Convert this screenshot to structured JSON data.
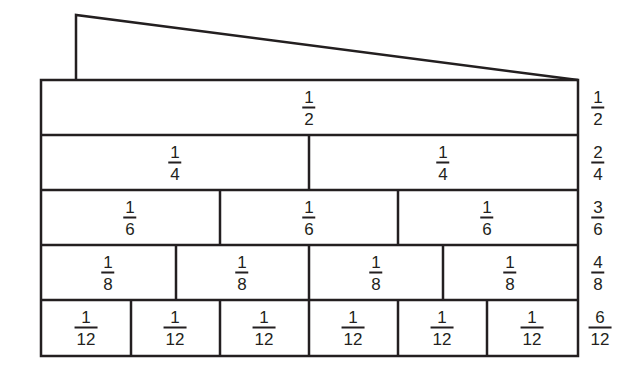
{
  "diagram": {
    "type": "fraction-wall",
    "colors": {
      "stroke": "#231f20",
      "background": "#ffffff"
    },
    "rows": [
      {
        "divisions": 2,
        "cells": [
          {
            "num": "1",
            "den": "2"
          }
        ],
        "equivalent": {
          "num": "1",
          "den": "2"
        }
      },
      {
        "divisions": 4,
        "cells": [
          {
            "num": "1",
            "den": "4"
          },
          {
            "num": "1",
            "den": "4"
          }
        ],
        "equivalent": {
          "num": "2",
          "den": "4"
        }
      },
      {
        "divisions": 6,
        "cells": [
          {
            "num": "1",
            "den": "6"
          },
          {
            "num": "1",
            "den": "6"
          },
          {
            "num": "1",
            "den": "6"
          }
        ],
        "equivalent": {
          "num": "3",
          "den": "6"
        }
      },
      {
        "divisions": 8,
        "cells": [
          {
            "num": "1",
            "den": "8"
          },
          {
            "num": "1",
            "den": "8"
          },
          {
            "num": "1",
            "den": "8"
          },
          {
            "num": "1",
            "den": "8"
          }
        ],
        "equivalent": {
          "num": "4",
          "den": "8"
        }
      },
      {
        "divisions": 12,
        "cells": [
          {
            "num": "1",
            "den": "12"
          },
          {
            "num": "1",
            "den": "12"
          },
          {
            "num": "1",
            "den": "12"
          },
          {
            "num": "1",
            "den": "12"
          },
          {
            "num": "1",
            "den": "12"
          },
          {
            "num": "1",
            "den": "12"
          }
        ],
        "equivalent": {
          "num": "6",
          "den": "12"
        }
      }
    ]
  }
}
